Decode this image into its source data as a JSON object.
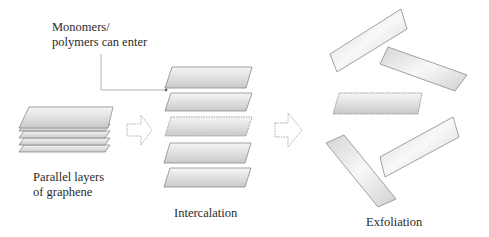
{
  "diagram": {
    "labels": {
      "callout_line1": "Monomers/",
      "callout_line2": "polymers can enter",
      "stage1_line1": "Parallel layers",
      "stage1_line2": "of graphene",
      "stage2": "Intercalation",
      "stage3": "Exfoliation"
    },
    "stages": [
      {
        "name": "Parallel layers of graphene",
        "layers": 5,
        "arrangement": "stacked"
      },
      {
        "name": "Intercalation",
        "layers": 5,
        "arrangement": "spaced-stack"
      },
      {
        "name": "Exfoliation",
        "layers": 5,
        "arrangement": "randomly-dispersed"
      }
    ],
    "arrows": [
      {
        "from": "Parallel layers of graphene",
        "to": "Intercalation",
        "style": "hollow-dashed"
      },
      {
        "from": "Intercalation",
        "to": "Exfoliation",
        "style": "hollow-dashed"
      }
    ],
    "colors": {
      "sheet_stroke": "#8a8a8a",
      "sheet_fill_light": "#f4f4f4",
      "sheet_fill_dark": "#c8c8c8",
      "arrow_stroke": "#9a9a9a",
      "callout_line": "#a0a0a0",
      "text": "#2a2a2a"
    }
  }
}
